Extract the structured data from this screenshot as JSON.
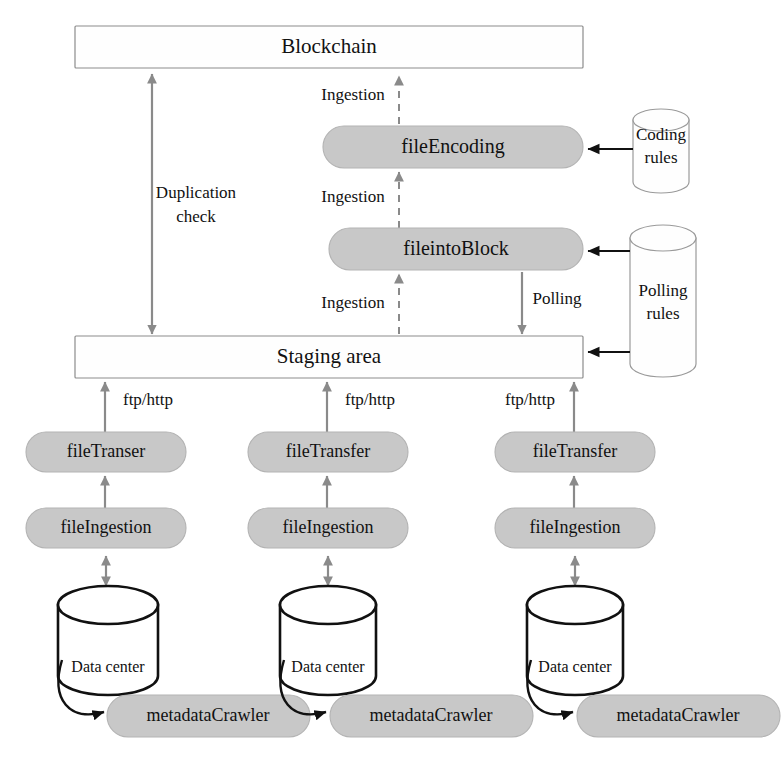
{
  "diagram": {
    "canvas": {
      "width": 782,
      "height": 770
    },
    "colors": {
      "pill_fill": "#c8c8c8",
      "pill_stroke": "#b3b3b3",
      "box_fill": "#fefefe",
      "box_stroke": "#8c8c8c",
      "gray_arrow": "#8a8a8a",
      "black_arrow": "#111111",
      "datacenter_stroke": "#111111",
      "text": "#111111"
    }
  },
  "nodes": {
    "blockchain": {
      "label": "Blockchain",
      "shape": "rectangle"
    },
    "staging_area": {
      "label": "Staging area",
      "shape": "rectangle"
    },
    "file_encoding": {
      "label": "fileEncoding",
      "shape": "pill"
    },
    "file_into_block": {
      "label": "fileintoBlock",
      "shape": "pill"
    },
    "coding_rules": {
      "label_line1": "Coding",
      "label_line2": "rules",
      "shape": "cylinder"
    },
    "polling_rules": {
      "label_line1": "Polling",
      "label_line2": "rules",
      "shape": "cylinder"
    },
    "file_transfer": [
      {
        "label": "fileTranser",
        "shape": "pill"
      },
      {
        "label": "fileTransfer",
        "shape": "pill"
      },
      {
        "label": "fileTransfer",
        "shape": "pill"
      }
    ],
    "file_ingestion": [
      {
        "label": "fileIngestion",
        "shape": "pill"
      },
      {
        "label": "fileIngestion",
        "shape": "pill"
      },
      {
        "label": "fileIngestion",
        "shape": "pill"
      }
    ],
    "data_center": [
      {
        "label": "Data center",
        "shape": "cylinder"
      },
      {
        "label": "Data center",
        "shape": "cylinder"
      },
      {
        "label": "Data center",
        "shape": "cylinder"
      }
    ],
    "metadata_crawler": [
      {
        "label": "metadataCrawler",
        "shape": "pill"
      },
      {
        "label": "metadataCrawler",
        "shape": "pill"
      },
      {
        "label": "metadataCrawler",
        "shape": "pill"
      }
    ]
  },
  "edges": {
    "duplication_check": {
      "label_line1": "Duplication",
      "label_line2": "check",
      "style": "solid-gray",
      "arrowheads": "both"
    },
    "ingestion_top": {
      "label": "Ingestion",
      "style": "dashed-gray",
      "arrowheads": "up"
    },
    "ingestion_middle": {
      "label": "Ingestion",
      "style": "dashed-gray",
      "arrowheads": "up"
    },
    "ingestion_bottom": {
      "label": "Ingestion",
      "style": "dashed-gray",
      "arrowheads": "up"
    },
    "polling": {
      "label": "Polling",
      "style": "solid-gray",
      "arrowheads": "down"
    },
    "ftp_http": [
      {
        "label": "ftp/http",
        "style": "solid-gray",
        "arrowheads": "up"
      },
      {
        "label": "ftp/http",
        "style": "solid-gray",
        "arrowheads": "up"
      },
      {
        "label": "ftp/http",
        "style": "solid-gray",
        "arrowheads": "up"
      }
    ],
    "coding_rules_to_file_encoding": {
      "label": "",
      "style": "solid-black",
      "arrowheads": "left"
    },
    "polling_rules_to_file_into_block": {
      "label": "",
      "style": "solid-black",
      "arrowheads": "left"
    },
    "polling_rules_to_staging_area": {
      "label": "",
      "style": "solid-black",
      "arrowheads": "left"
    }
  }
}
